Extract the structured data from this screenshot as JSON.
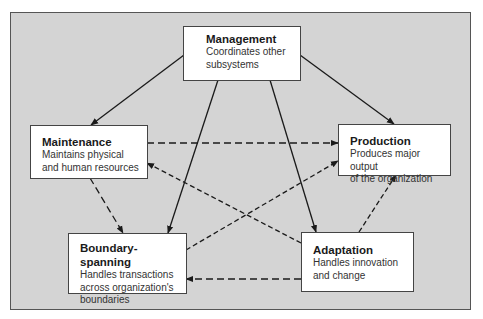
{
  "diagram": {
    "type": "subsystems-flow",
    "colors": {
      "background": "#d4d4d4",
      "box_fill": "#ffffff",
      "line": "#1a1a1a"
    },
    "nodes": {
      "management": {
        "title": "Management",
        "description_line1": "Coordinates other",
        "description_line2": "subsystems"
      },
      "maintenance": {
        "title": "Maintenance",
        "description_line1": "Maintains physical",
        "description_line2": "and human resources"
      },
      "production": {
        "title": "Production",
        "description_line1": "Produces major output",
        "description_line2": "of the organization"
      },
      "boundary_spanning": {
        "title": "Boundary-spanning",
        "description_line1": "Handles transactions",
        "description_line2": "across organization's",
        "description_line3": "boundaries"
      },
      "adaptation": {
        "title": "Adaptation",
        "description_line1": "Handles innovation",
        "description_line2": "and change"
      }
    },
    "edges": [
      {
        "from": "Management",
        "to": "Maintenance",
        "style": "solid"
      },
      {
        "from": "Management",
        "to": "Production",
        "style": "solid"
      },
      {
        "from": "Management",
        "to": "Boundary-spanning",
        "style": "solid"
      },
      {
        "from": "Management",
        "to": "Adaptation",
        "style": "solid"
      },
      {
        "from": "Maintenance",
        "to": "Production",
        "style": "dashed"
      },
      {
        "from": "Maintenance",
        "to": "Boundary-spanning",
        "style": "dashed"
      },
      {
        "from": "Adaptation",
        "to": "Maintenance",
        "style": "dashed"
      },
      {
        "from": "Boundary-spanning",
        "to": "Production",
        "style": "dashed"
      },
      {
        "from": "Adaptation",
        "to": "Production",
        "style": "dashed"
      },
      {
        "from": "Adaptation",
        "to": "Boundary-spanning",
        "style": "dashed"
      }
    ]
  }
}
